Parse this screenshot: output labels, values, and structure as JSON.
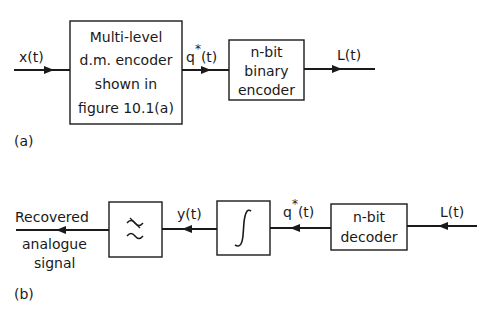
{
  "diagram_a": {
    "panel_label": "(a)",
    "input_signal": "x(t)",
    "block1": {
      "lines": [
        "Multi-level",
        "d.m. encoder",
        "shown in",
        "figure 10.1(a)"
      ]
    },
    "mid_signal": {
      "base": "q",
      "sup": "*",
      "arg": "(t)"
    },
    "block2": {
      "lines": [
        "n-bit",
        "binary",
        "encoder"
      ]
    },
    "output_signal": "L(t)"
  },
  "diagram_b": {
    "panel_label": "(b)",
    "input_signal": "L(t)",
    "decoder_block": {
      "lines": [
        "n-bit",
        "decoder"
      ]
    },
    "mid_signal": {
      "base": "q",
      "sup": "*",
      "arg": "(t)"
    },
    "integrator_block": {
      "symbol": "∫"
    },
    "integrator_output": "y(t)",
    "filter_block": {
      "symbol_top": "≈",
      "symbol_bottom": "~",
      "meaning": "low-pass-filter"
    },
    "output_label": [
      "Recovered",
      "analogue",
      "signal"
    ]
  }
}
